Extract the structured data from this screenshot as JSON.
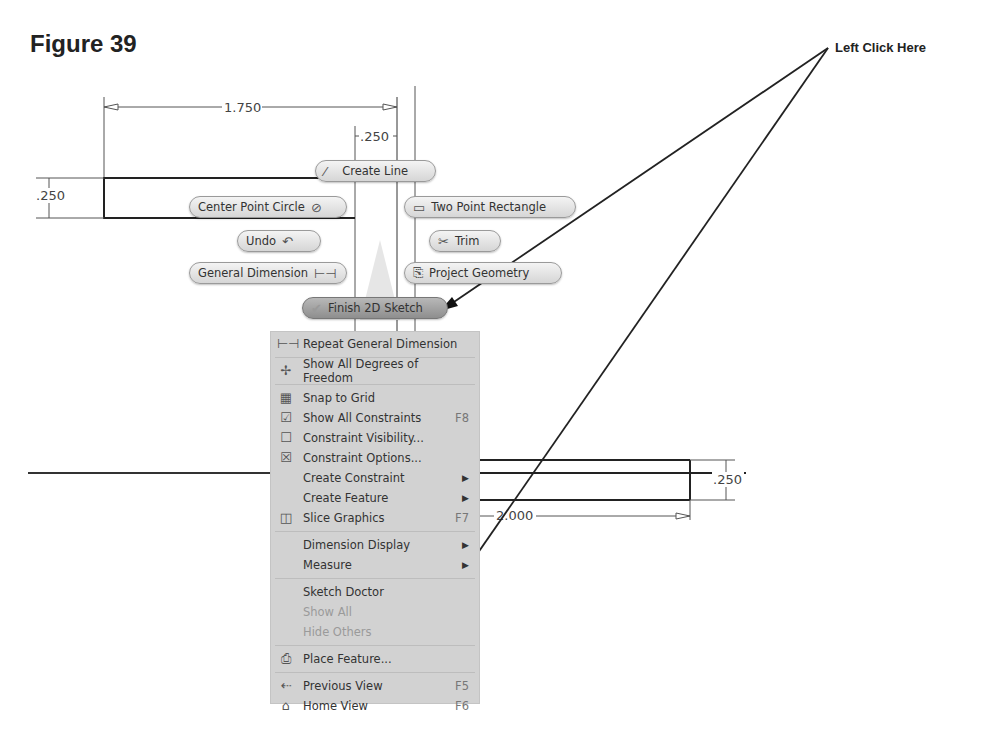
{
  "figure": {
    "title": "Figure 39"
  },
  "callout": {
    "text": "Left Click Here"
  },
  "dimensions": {
    "top_width": "1.750",
    "small_width": ".250",
    "left_height": ".250",
    "right_height": ".250",
    "bottom_width": "2.000"
  },
  "marking_menu": {
    "create_line": "Create Line",
    "center_point_circle": "Center Point Circle",
    "two_point_rectangle": "Two Point Rectangle",
    "undo": "Undo",
    "trim": "Trim",
    "general_dimension": "General Dimension",
    "project_geometry": "Project Geometry",
    "finish_2d_sketch": "Finish 2D Sketch"
  },
  "context_menu": {
    "items": [
      {
        "label": "Repeat General Dimension",
        "icon": "dimension-icon",
        "shortcut": "",
        "submenu": false,
        "disabled": false
      },
      {
        "label": "Show All Degrees of Freedom",
        "icon": "degrees-of-freedom-icon",
        "shortcut": "",
        "submenu": false,
        "disabled": false
      },
      {
        "label": "Snap to Grid",
        "icon": "grid-icon",
        "shortcut": "",
        "submenu": false,
        "disabled": false
      },
      {
        "label": "Show All Constraints",
        "icon": "constraints-icon",
        "shortcut": "F8",
        "submenu": false,
        "disabled": false
      },
      {
        "label": "Constraint Visibility...",
        "icon": "constraint-visibility-icon",
        "shortcut": "",
        "submenu": false,
        "disabled": false
      },
      {
        "label": "Constraint Options...",
        "icon": "constraint-options-icon",
        "shortcut": "",
        "submenu": false,
        "disabled": false
      },
      {
        "label": "Create Constraint",
        "icon": "",
        "shortcut": "",
        "submenu": true,
        "disabled": false
      },
      {
        "label": "Create Feature",
        "icon": "",
        "shortcut": "",
        "submenu": true,
        "disabled": false
      },
      {
        "label": "Slice Graphics",
        "icon": "slice-graphics-icon",
        "shortcut": "F7",
        "submenu": false,
        "disabled": false
      },
      {
        "label": "Dimension Display",
        "icon": "",
        "shortcut": "",
        "submenu": true,
        "disabled": false
      },
      {
        "label": "Measure",
        "icon": "",
        "shortcut": "",
        "submenu": true,
        "disabled": false
      },
      {
        "label": "Sketch Doctor",
        "icon": "",
        "shortcut": "",
        "submenu": false,
        "disabled": false
      },
      {
        "label": "Show All",
        "icon": "",
        "shortcut": "",
        "submenu": false,
        "disabled": true
      },
      {
        "label": "Hide Others",
        "icon": "",
        "shortcut": "",
        "submenu": false,
        "disabled": true
      },
      {
        "label": "Place Feature...",
        "icon": "place-feature-icon",
        "shortcut": "",
        "submenu": false,
        "disabled": false
      },
      {
        "label": "Previous View",
        "icon": "previous-view-icon",
        "shortcut": "F5",
        "submenu": false,
        "disabled": false
      },
      {
        "label": "Home View",
        "icon": "home-view-icon",
        "shortcut": "F6",
        "submenu": false,
        "disabled": false
      }
    ]
  }
}
